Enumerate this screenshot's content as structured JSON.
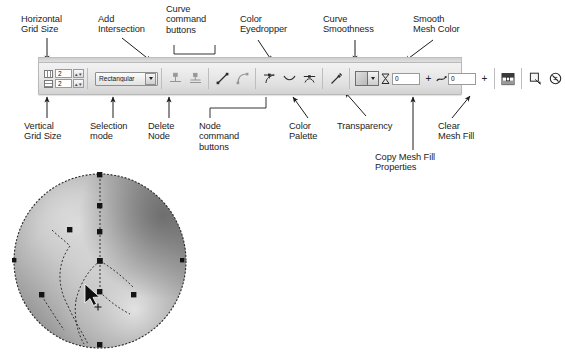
{
  "figure": {
    "app_context": "mesh fill property bar",
    "callouts_top": [
      {
        "id": "horizontal-grid-size",
        "text": "Horizontal\nGrid Size"
      },
      {
        "id": "add-intersection",
        "text": "Add\nIntersection"
      },
      {
        "id": "curve-command-buttons",
        "text": "Curve\ncommand\nbuttons"
      },
      {
        "id": "color-eyedropper",
        "text": "Color\nEyedropper"
      },
      {
        "id": "curve-smoothness",
        "text": "Curve\nSmoothness"
      },
      {
        "id": "smooth-mesh-color",
        "text": "Smooth\nMesh Color"
      }
    ],
    "callouts_bottom": [
      {
        "id": "vertical-grid-size",
        "text": "Vertical\nGrid Size"
      },
      {
        "id": "selection-mode",
        "text": "Selection\nmode"
      },
      {
        "id": "delete-node",
        "text": "Delete\nNode"
      },
      {
        "id": "node-command-buttons",
        "text": "Node\ncommand\nbuttons"
      },
      {
        "id": "color-palette",
        "text": "Color\nPalette"
      },
      {
        "id": "transparency",
        "text": "Transparency"
      },
      {
        "id": "clear-mesh-fill",
        "text": "Clear\nMesh Fill"
      },
      {
        "id": "copy-mesh-fill-properties",
        "text": "Copy Mesh Fill\nProperties"
      }
    ]
  },
  "toolbar": {
    "grid": {
      "horizontal_value": "2",
      "vertical_value": "2",
      "spinner_glyph": "▴▾"
    },
    "selection_mode": {
      "value": "Rectangular",
      "options": [
        "Rectangular",
        "Freehand"
      ]
    },
    "buttons": {
      "add_intersection": "Add Intersection",
      "delete_node": "Delete Node",
      "curve_to_line": "To Line",
      "curve_to_curve": "To Curve",
      "node_cusp": "Make Node Cusp",
      "node_smooth": "Make Node Smooth",
      "node_symmetrical": "Make Node Symmetrical",
      "eyedropper": "Color Eyedropper",
      "smooth_mesh_color": "Smooth Mesh Color",
      "copy_mesh_fill_properties": "Copy Mesh Fill Properties",
      "clear_mesh_fill": "Clear Mesh Fill"
    },
    "color_palette": {
      "swatch_color": "#b8b8b8",
      "dropdown_glyph": "▾"
    },
    "transparency": {
      "value": "0",
      "plus_glyph": "+"
    },
    "curve_smoothness": {
      "value": "0",
      "plus_glyph": "+"
    }
  },
  "artwork": {
    "name": "mesh-filled-ellipse",
    "description": "ellipse with mesh fill, dashed mesh curves and square mesh nodes",
    "fill_light": "#f0f0f0",
    "fill_dark": "#6a6a6a",
    "node_color": "#141414",
    "cursor": "mesh-fill-pointer"
  }
}
